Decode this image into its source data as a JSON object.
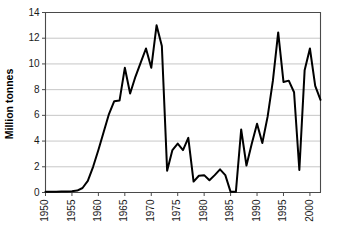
{
  "chart_data": {
    "type": "line",
    "title": "",
    "xlabel": "",
    "ylabel": "Million tonnes",
    "xlim": [
      1950,
      2002
    ],
    "ylim": [
      0,
      14
    ],
    "grid": true,
    "legend": "none",
    "yticks": [
      0,
      2,
      4,
      6,
      8,
      10,
      12,
      14
    ],
    "ytick_labels": [
      "0",
      "2",
      "4",
      "6",
      "8",
      "10",
      "12",
      "14"
    ],
    "xticks": [
      1950,
      1955,
      1960,
      1965,
      1970,
      1975,
      1980,
      1985,
      1990,
      1995,
      2000
    ],
    "xtick_labels": [
      "1950",
      "1955",
      "1960",
      "1965",
      "1970",
      "1975",
      "1980",
      "1985",
      "1990",
      "1995",
      "2000"
    ],
    "series": [
      {
        "name": "Million tonnes",
        "color": "#000000",
        "x": [
          1950,
          1951,
          1952,
          1953,
          1954,
          1955,
          1956,
          1957,
          1958,
          1959,
          1960,
          1961,
          1962,
          1963,
          1964,
          1965,
          1966,
          1967,
          1968,
          1969,
          1970,
          1971,
          1972,
          1973,
          1974,
          1975,
          1976,
          1977,
          1978,
          1979,
          1980,
          1981,
          1982,
          1983,
          1984,
          1985,
          1986,
          1987,
          1988,
          1989,
          1990,
          1991,
          1992,
          1993,
          1994,
          1995,
          1996,
          1997,
          1998,
          1999,
          2000,
          2001,
          2002
        ],
        "values": [
          0.05,
          0.05,
          0.06,
          0.07,
          0.08,
          0.1,
          0.15,
          0.35,
          0.9,
          2.0,
          3.3,
          4.7,
          6.1,
          7.1,
          7.15,
          9.7,
          7.7,
          9.0,
          10.1,
          11.2,
          9.7,
          13.0,
          11.4,
          1.7,
          3.3,
          3.8,
          3.3,
          4.25,
          0.85,
          1.3,
          1.35,
          0.95,
          1.35,
          1.8,
          1.35,
          0.05,
          0.05,
          4.9,
          2.1,
          3.8,
          5.35,
          3.85,
          5.9,
          8.7,
          12.45,
          8.6,
          8.7,
          7.8,
          1.75,
          9.5,
          11.2,
          8.3,
          7.2
        ]
      }
    ]
  },
  "axis": {
    "ylabel": "Million tonnes"
  }
}
